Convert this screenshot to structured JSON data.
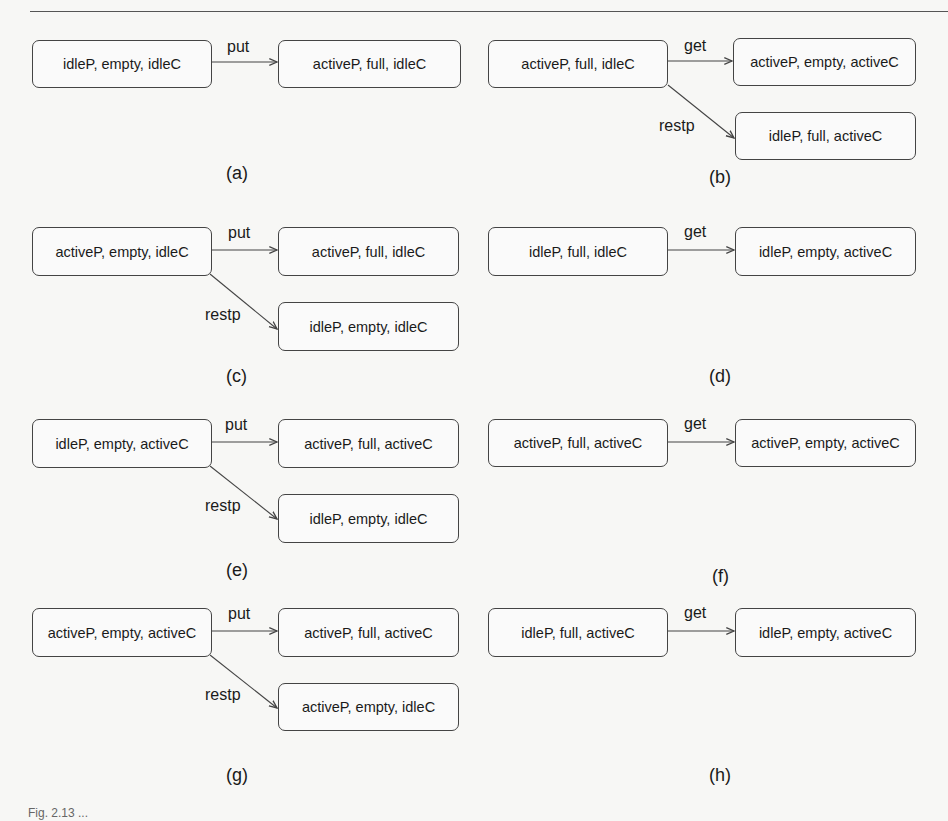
{
  "figure": {
    "panels": [
      {
        "id": "a",
        "caption": "(a)",
        "source": "idleP, empty, idleC",
        "transitions": [
          {
            "label": "put",
            "target": "activeP, full, idleC"
          }
        ]
      },
      {
        "id": "b",
        "caption": "(b)",
        "source": "activeP, full, idleC",
        "transitions": [
          {
            "label": "get",
            "target": "activeP, empty, activeC"
          },
          {
            "label": "restp",
            "target": "idleP, full, activeC"
          }
        ]
      },
      {
        "id": "c",
        "caption": "(c)",
        "source": "activeP, empty, idleC",
        "transitions": [
          {
            "label": "put",
            "target": "activeP, full, idleC"
          },
          {
            "label": "restp",
            "target": "idleP, empty, idleC"
          }
        ]
      },
      {
        "id": "d",
        "caption": "(d)",
        "source": "idleP, full, idleC",
        "transitions": [
          {
            "label": "get",
            "target": "idleP, empty, activeC"
          }
        ]
      },
      {
        "id": "e",
        "caption": "(e)",
        "source": "idleP, empty, activeC",
        "transitions": [
          {
            "label": "put",
            "target": "activeP, full, activeC"
          },
          {
            "label": "restp",
            "target": "idleP, empty, idleC"
          }
        ]
      },
      {
        "id": "f",
        "caption": "(f)",
        "source": "activeP, full, activeC",
        "transitions": [
          {
            "label": "get",
            "target": "activeP, empty, activeC"
          }
        ]
      },
      {
        "id": "g",
        "caption": "(g)",
        "source": "activeP, empty, activeC",
        "transitions": [
          {
            "label": "put",
            "target": "activeP, full, activeC"
          },
          {
            "label": "restp",
            "target": "activeP, empty, idleC"
          }
        ]
      },
      {
        "id": "h",
        "caption": "(h)",
        "source": "idleP, full, activeC",
        "transitions": [
          {
            "label": "get",
            "target": "idleP, empty, activeC"
          }
        ]
      }
    ],
    "footer_caption": "Fig. 2.13 ..."
  },
  "colors": {
    "line": "#444444",
    "background": "#f7f7f5"
  }
}
